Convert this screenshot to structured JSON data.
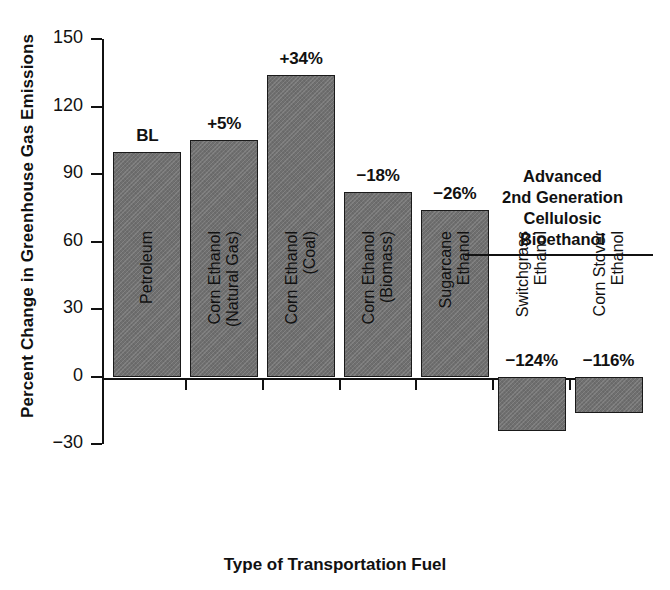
{
  "chart_data": {
    "type": "bar",
    "title": "",
    "xlabel": "Type of Transportation Fuel",
    "ylabel": "Percent Change in Greenhouse Gas Emissions",
    "ylim": [
      -30,
      150
    ],
    "yticks": [
      150,
      120,
      90,
      60,
      30,
      0,
      -30
    ],
    "ytick_labels": [
      "150",
      "120",
      "90",
      "60",
      "30",
      "0",
      "−30"
    ],
    "grid": false,
    "legend": null,
    "bar_color": "#6f6f6f",
    "categories": [
      "Petroleum",
      "Corn Ethanol (Natural Gas)",
      "Corn Ethanol (Coal)",
      "Corn Ethanol (Biomass)",
      "Sugarcane Ethanol",
      "Switchgrass Ethanol",
      "Corn Stover Ethanol"
    ],
    "category_lines": [
      [
        "Petroleum"
      ],
      [
        "Corn Ethanol",
        "(Natural Gas)"
      ],
      [
        "Corn Ethanol",
        "(Coal)"
      ],
      [
        "Corn Ethanol",
        "(Biomass)"
      ],
      [
        "Sugarcane",
        "Ethanol"
      ],
      [
        "Switchgrass",
        "Ethanol"
      ],
      [
        "Corn Stover",
        "Ethanol"
      ]
    ],
    "values": [
      100,
      105,
      134,
      82,
      74,
      -24,
      -16
    ],
    "data_labels": [
      "BL",
      "+5%",
      "+34%",
      "−18%",
      "−26%",
      "−124%",
      "−116%"
    ],
    "annotations": [
      {
        "lines": [
          "Advanced",
          "2nd Generation",
          "Cellulosic",
          "Bioethanol"
        ],
        "underline": true
      }
    ]
  },
  "bars": [
    {
      "label": "BL",
      "category": "Petroleum",
      "value": 100
    },
    {
      "label": "+5%",
      "category": "Corn Ethanol (Natural Gas)",
      "value": 105
    },
    {
      "label": "+34%",
      "category": "Corn Ethanol (Coal)",
      "value": 134
    },
    {
      "label": "−18%",
      "category": "Corn Ethanol (Biomass)",
      "value": 82
    },
    {
      "label": "−26%",
      "category": "Sugarcane Ethanol",
      "value": 74
    },
    {
      "label": "−124%",
      "category": "Switchgrass Ethanol",
      "value": -24
    },
    {
      "label": "−116%",
      "category": "Corn Stover Ethanol",
      "value": -16
    }
  ],
  "axes": {
    "y_title": "Percent Change in Greenhouse Gas Emissions",
    "x_title": "Type of Transportation Fuel",
    "y_tick_labels": [
      "150",
      "120",
      "90",
      "60",
      "30",
      "0",
      "−30"
    ]
  },
  "annotation": {
    "line1": "Advanced",
    "line2": "2nd Generation",
    "line3": "Cellulosic",
    "line4": "Bioethanol"
  }
}
